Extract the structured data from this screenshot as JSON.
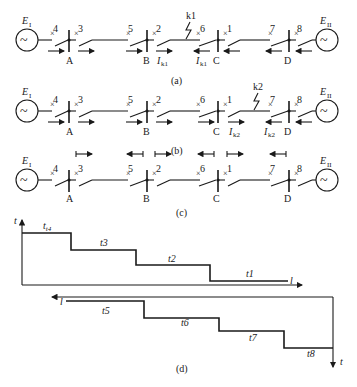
{
  "figure": {
    "panels": {
      "a": {
        "caption": "(a)",
        "fault": "k1",
        "sources": {
          "left": "E",
          "left_sub": "I",
          "right": "E",
          "right_sub": "II"
        },
        "buses": [
          "A",
          "B",
          "C",
          "D"
        ],
        "breakers": [
          "4",
          "3",
          "5",
          "2",
          "6",
          "1",
          "7",
          "8"
        ],
        "current_labels": [
          {
            "text": "I",
            "sub": "k1"
          },
          {
            "text": "I",
            "sub": "k1"
          }
        ]
      },
      "b": {
        "caption": "(b)",
        "fault": "k2",
        "sources": {
          "left": "E",
          "left_sub": "I",
          "right": "E",
          "right_sub": "II"
        },
        "buses": [
          "A",
          "B",
          "C",
          "D"
        ],
        "breakers": [
          "4",
          "3",
          "5",
          "2",
          "6",
          "1",
          "7",
          "8"
        ],
        "current_labels": [
          {
            "text": "I",
            "sub": "k2"
          },
          {
            "text": "I",
            "sub": "k2"
          }
        ]
      },
      "c": {
        "caption": "(c)",
        "sources": {
          "left": "E",
          "left_sub": "I",
          "right": "E",
          "right_sub": "II"
        },
        "buses": [
          "A",
          "B",
          "C",
          "D"
        ],
        "breakers": [
          "4",
          "3",
          "5",
          "2",
          "6",
          "1",
          "7",
          "8"
        ]
      },
      "d": {
        "caption": "(d)",
        "top_axis_t": "t",
        "top_axis_l": "l",
        "top_steps": [
          "t4",
          "t3",
          "t2",
          "t1"
        ],
        "bottom_axis_l": "l",
        "bottom_axis_t": "t",
        "bottom_steps": [
          "t5",
          "t6",
          "t7",
          "t8"
        ]
      }
    }
  }
}
